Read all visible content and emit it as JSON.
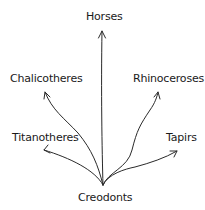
{
  "diagram": {
    "type": "phylogenetic-tree",
    "root": "Creodonts",
    "branches": [
      "Horses",
      "Chalicotheres",
      "Rhinoceroses",
      "Titanotheres",
      "Tapirs"
    ]
  },
  "labels": {
    "root": "Creodonts",
    "horses": "Horses",
    "chalicotheres": "Chalicotheres",
    "rhinoceroses": "Rhinoceroses",
    "titanotheres": "Titanotheres",
    "tapirs": "Tapirs"
  },
  "colors": {
    "line": "#2a2a2a",
    "text": "#1a1a1a"
  }
}
